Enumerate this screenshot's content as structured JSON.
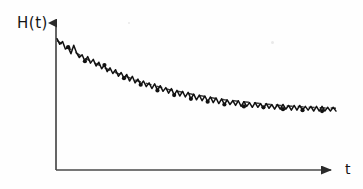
{
  "figure": {
    "title": "",
    "background_color": "#fefefe",
    "ink_color": "#111111",
    "axis_color": "#4a4a4a"
  },
  "axes": {
    "ylabel": "H(t)",
    "xlabel": "t",
    "y_axis_arrow": "arrow-up",
    "x_axis_arrow": "arrow-right",
    "origin_px": [
      56,
      170
    ],
    "y_axis_top_px": [
      56,
      15
    ],
    "x_axis_right_px": [
      340,
      170
    ],
    "ticks": [],
    "gridlines": false
  },
  "chart_data": {
    "type": "line",
    "title": "",
    "subtitle": "",
    "xlabel": "t",
    "ylabel": "H(t)",
    "xlim": [
      0,
      100
    ],
    "ylim": [
      0,
      100
    ],
    "grid": false,
    "legend_position": "none",
    "annotations": [],
    "series": [
      {
        "name": "H(t) noisy signal",
        "style": "jagged-polyline",
        "color": "#111111",
        "marker": "dot-at-selected-peaks",
        "x": [
          0,
          1,
          2,
          3,
          4,
          5,
          6,
          7,
          8,
          9,
          10,
          11,
          12,
          13,
          14,
          15,
          16,
          17,
          18,
          19,
          20,
          21,
          22,
          23,
          24,
          25,
          26,
          27,
          28,
          29,
          30,
          31,
          32,
          33,
          34,
          35,
          36,
          37,
          38,
          39,
          40,
          41,
          42,
          43,
          44,
          45,
          46,
          47,
          48,
          49,
          50,
          51,
          52,
          53,
          54,
          55,
          56,
          57,
          58,
          59,
          60,
          61,
          62,
          63,
          64,
          65,
          66,
          67,
          68,
          69,
          70,
          71,
          72,
          73,
          74,
          75,
          76,
          77,
          78,
          79,
          80,
          81,
          82,
          83,
          84,
          85,
          86,
          87,
          88,
          89,
          90,
          91,
          92,
          93,
          94,
          95,
          96,
          97,
          98,
          99,
          100
        ],
        "values": [
          95,
          89,
          92,
          84,
          86,
          79,
          88,
          80,
          75,
          78,
          71,
          76,
          69,
          73,
          66,
          70,
          63,
          67,
          60,
          64,
          58,
          62,
          55,
          59,
          53,
          57,
          50,
          55,
          48,
          52,
          46,
          50,
          44,
          48,
          42,
          47,
          40,
          45,
          39,
          43,
          37,
          42,
          35,
          40,
          34,
          39,
          33,
          38,
          31,
          36,
          30,
          35,
          29,
          34,
          28,
          33,
          27,
          32,
          26,
          31,
          25,
          30,
          25,
          29,
          24,
          29,
          23,
          28,
          23,
          27,
          22,
          27,
          22,
          26,
          21,
          26,
          21,
          25,
          20,
          25,
          20,
          25,
          20,
          24,
          19,
          24,
          19,
          24,
          19,
          23,
          19,
          23,
          18,
          23,
          18,
          23,
          18,
          22,
          18,
          22,
          18
        ]
      },
      {
        "name": "trend (exponential decay)",
        "style": "dashed",
        "color": "#3c3c3c",
        "dash_pattern": "6 5",
        "x": [
          0,
          10,
          20,
          30,
          40,
          50,
          60,
          70,
          80,
          90,
          100
        ],
        "values": [
          93,
          74,
          60,
          49,
          41,
          35,
          30,
          27,
          24,
          22,
          21
        ]
      }
    ],
    "markers": {
      "description": "filled round dots placed on selected local maxima of the noisy series",
      "x": [
        4,
        10,
        17,
        24,
        30,
        36,
        42,
        48,
        54,
        60,
        67,
        74,
        81,
        88,
        95
      ],
      "values": [
        86,
        71,
        67,
        53,
        46,
        40,
        35,
        31,
        28,
        25,
        23,
        22,
        20,
        19,
        18
      ]
    }
  }
}
